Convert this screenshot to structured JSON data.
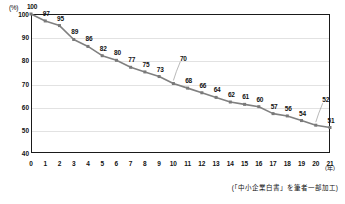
{
  "chart_data": {
    "type": "line",
    "title": "",
    "xlabel": "(年)",
    "ylabel": "(%)",
    "x": [
      0,
      1,
      2,
      3,
      4,
      5,
      6,
      7,
      8,
      9,
      10,
      11,
      12,
      13,
      14,
      15,
      16,
      17,
      18,
      19,
      20,
      21
    ],
    "values": [
      100,
      97,
      95,
      89,
      86,
      82,
      80,
      77,
      75,
      73,
      70,
      68,
      66,
      64,
      62,
      61,
      60,
      57,
      56,
      54,
      52,
      51
    ],
    "categories": [
      "0",
      "1",
      "2",
      "3",
      "4",
      "5",
      "6",
      "7",
      "8",
      "9",
      "10",
      "11",
      "12",
      "13",
      "14",
      "15",
      "16",
      "17",
      "18",
      "19",
      "20",
      "21"
    ],
    "xlim": [
      0,
      21
    ],
    "ylim": [
      40,
      100
    ],
    "ytick_labels": [
      "100",
      "90",
      "80",
      "70",
      "60",
      "50",
      "40"
    ],
    "ytick_values": [
      100,
      90,
      80,
      70,
      60,
      50,
      40
    ],
    "grid": true,
    "legend": "none",
    "series_color": "#808080",
    "marker_color": "#7a7a7a",
    "grid_color": "#e2e2e2",
    "axis_color": "#1a1a1a",
    "data_labels": [
      {
        "x": 0,
        "value": 100,
        "text": "100",
        "leader": false
      },
      {
        "x": 1,
        "value": 97,
        "text": "97",
        "leader": false
      },
      {
        "x": 2,
        "value": 95,
        "text": "95",
        "leader": false
      },
      {
        "x": 3,
        "value": 89,
        "text": "89",
        "leader": false
      },
      {
        "x": 4,
        "value": 86,
        "text": "86",
        "leader": false
      },
      {
        "x": 5,
        "value": 82,
        "text": "82",
        "leader": false
      },
      {
        "x": 6,
        "value": 80,
        "text": "80",
        "leader": false
      },
      {
        "x": 7,
        "value": 77,
        "text": "77",
        "leader": false
      },
      {
        "x": 8,
        "value": 75,
        "text": "75",
        "leader": false
      },
      {
        "x": 9,
        "value": 73,
        "text": "73",
        "leader": false
      },
      {
        "x": 10,
        "value": 70,
        "text": "70",
        "leader": true
      },
      {
        "x": 11,
        "value": 68,
        "text": "68",
        "leader": false
      },
      {
        "x": 12,
        "value": 66,
        "text": "66",
        "leader": false
      },
      {
        "x": 13,
        "value": 64,
        "text": "64",
        "leader": false
      },
      {
        "x": 14,
        "value": 62,
        "text": "62",
        "leader": false
      },
      {
        "x": 15,
        "value": 61,
        "text": "61",
        "leader": false
      },
      {
        "x": 16,
        "value": 60,
        "text": "60",
        "leader": false
      },
      {
        "x": 17,
        "value": 57,
        "text": "57",
        "leader": false
      },
      {
        "x": 18,
        "value": 56,
        "text": "56",
        "leader": false
      },
      {
        "x": 19,
        "value": 54,
        "text": "54",
        "leader": false
      },
      {
        "x": 20,
        "value": 52,
        "text": "52",
        "leader": true
      },
      {
        "x": 21,
        "value": 51,
        "text": "51",
        "leader": false
      }
    ]
  },
  "footer": {
    "source_note": "(「中小企業白書」を筆者一部加工)"
  }
}
